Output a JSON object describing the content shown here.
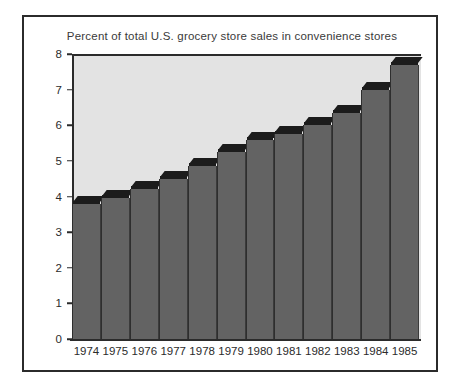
{
  "chart_data": {
    "type": "bar",
    "title": "Percent of total U.S. grocery store sales in convenience stores",
    "xlabel": "",
    "ylabel": "",
    "ylim": [
      0,
      8
    ],
    "yticks": [
      "0",
      "1",
      "2",
      "3",
      "4",
      "5",
      "6",
      "7",
      "8"
    ],
    "grid": false,
    "legend": null,
    "categories": [
      "1974",
      "1975",
      "1976",
      "1977",
      "1978",
      "1979",
      "1980",
      "1981",
      "1982",
      "1983",
      "1984",
      "1985"
    ],
    "values": [
      3.8,
      3.95,
      4.2,
      4.5,
      4.85,
      5.25,
      5.6,
      5.75,
      6.0,
      6.35,
      7.0,
      7.7
    ],
    "colors": {
      "bar_face": "#636363",
      "bar_top": "#1c1c1c",
      "plot_background": "#e3e3e3",
      "axis": "#2b2b2b",
      "page_background": "#ffffff",
      "title_text": "#3a3a3a"
    }
  }
}
